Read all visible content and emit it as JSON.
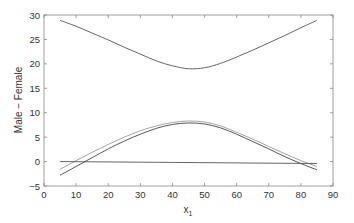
{
  "chart_data": {
    "type": "line",
    "title": "",
    "xlabel": "x",
    "xlabel_subscript": "1",
    "ylabel": "Male − Female",
    "xlim": [
      0,
      90
    ],
    "ylim": [
      -5,
      30
    ],
    "xticks": [
      0,
      10,
      20,
      30,
      40,
      50,
      60,
      70,
      80,
      90
    ],
    "yticks": [
      -5,
      0,
      5,
      10,
      15,
      20,
      25,
      30
    ],
    "grid": false,
    "legend": null,
    "series": [
      {
        "name": "upper band",
        "color": "#555555",
        "x": [
          5,
          10,
          15,
          20,
          25,
          30,
          35,
          40,
          45,
          50,
          55,
          60,
          65,
          70,
          75,
          80,
          85
        ],
        "y": [
          28.9,
          27.7,
          26.3,
          24.9,
          23.4,
          22.0,
          20.6,
          19.6,
          19.0,
          19.2,
          20.1,
          21.4,
          22.8,
          24.3,
          25.8,
          27.4,
          28.9
        ]
      },
      {
        "name": "upper estimate",
        "color": "#999999",
        "x": [
          5,
          10,
          15,
          20,
          25,
          30,
          35,
          40,
          45,
          50,
          55,
          60,
          65,
          70,
          75,
          80,
          85
        ],
        "y": [
          -1.6,
          0.2,
          1.9,
          3.5,
          5.0,
          6.3,
          7.3,
          8.0,
          8.3,
          8.1,
          7.3,
          6.0,
          4.6,
          3.1,
          1.6,
          0.2,
          -1.0
        ]
      },
      {
        "name": "estimate",
        "color": "#444444",
        "x": [
          5,
          10,
          15,
          20,
          25,
          30,
          35,
          40,
          45,
          50,
          55,
          60,
          65,
          70,
          75,
          80,
          85
        ],
        "y": [
          -2.8,
          -1.0,
          0.8,
          2.6,
          4.2,
          5.6,
          6.8,
          7.6,
          7.9,
          7.7,
          6.9,
          5.6,
          4.1,
          2.6,
          1.0,
          -0.4,
          -1.7
        ]
      },
      {
        "name": "zero line",
        "color": "#555555",
        "x": [
          5,
          85
        ],
        "y": [
          0,
          -0.4
        ]
      }
    ]
  }
}
